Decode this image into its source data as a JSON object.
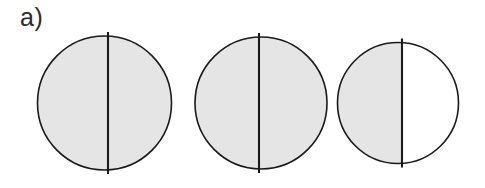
{
  "figure": {
    "panel_label": "a)",
    "background_color": "#ffffff",
    "width": 485,
    "height": 188
  },
  "style": {
    "shaded_color": "#e5e5e5",
    "unshaded_color": "#ffffff",
    "outline_color": "#1a1a1a",
    "divider_color": "#1a1a1a",
    "label_color": "#2b2b2b"
  },
  "chart_data": {
    "type": "diagram",
    "title": "a)",
    "items": [
      {
        "name": "circle-1",
        "cx": 104.5,
        "cy": 103,
        "r": 67,
        "divider_x": 108,
        "left_region_shaded": true,
        "right_region_shaded": true,
        "shaded_fraction": 1.0,
        "shaded_label": "fully shaded"
      },
      {
        "name": "circle-2",
        "cx": 261,
        "cy": 103,
        "r": 66,
        "divider_x": 259,
        "left_region_shaded": true,
        "right_region_shaded": true,
        "shaded_fraction": 1.0,
        "shaded_label": "fully shaded"
      },
      {
        "name": "circle-3",
        "cx": 398,
        "cy": 103,
        "r": 60.5,
        "divider_x": 402,
        "left_region_shaded": true,
        "right_region_shaded": false,
        "shaded_fraction": 0.52,
        "shaded_label": "left half shaded"
      }
    ],
    "divider_overhang_px": 4,
    "grid": false,
    "legend": null,
    "xlabel": "",
    "ylabel": ""
  }
}
